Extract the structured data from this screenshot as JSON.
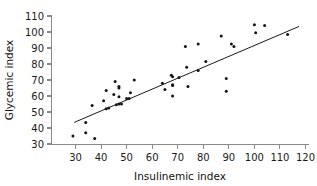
{
  "chart_data": {
    "type": "scatter",
    "title": "",
    "xlabel": "Insulinemic index",
    "ylabel": "Glycemic index",
    "xlim": [
      25,
      122
    ],
    "ylim": [
      27,
      112
    ],
    "xticks": [
      30,
      40,
      50,
      60,
      70,
      80,
      90,
      100,
      110,
      120
    ],
    "yticks": [
      30,
      40,
      50,
      60,
      70,
      80,
      90,
      100,
      110
    ],
    "grid": false,
    "legend": null,
    "points": [
      {
        "x": 29,
        "y": 35
      },
      {
        "x": 34,
        "y": 43.5
      },
      {
        "x": 34,
        "y": 37
      },
      {
        "x": 37.5,
        "y": 33.5
      },
      {
        "x": 36.5,
        "y": 54
      },
      {
        "x": 41,
        "y": 57
      },
      {
        "x": 42,
        "y": 63.5
      },
      {
        "x": 42,
        "y": 52
      },
      {
        "x": 43,
        "y": 52.5
      },
      {
        "x": 45.5,
        "y": 69
      },
      {
        "x": 45,
        "y": 61
      },
      {
        "x": 46,
        "y": 54.5
      },
      {
        "x": 47,
        "y": 66
      },
      {
        "x": 47,
        "y": 65
      },
      {
        "x": 47,
        "y": 59.5
      },
      {
        "x": 47,
        "y": 55
      },
      {
        "x": 48,
        "y": 55
      },
      {
        "x": 50,
        "y": 58.5
      },
      {
        "x": 51,
        "y": 58.5
      },
      {
        "x": 51.5,
        "y": 62
      },
      {
        "x": 53,
        "y": 70
      },
      {
        "x": 64,
        "y": 68
      },
      {
        "x": 65,
        "y": 64
      },
      {
        "x": 67.5,
        "y": 73
      },
      {
        "x": 68,
        "y": 72
      },
      {
        "x": 68,
        "y": 67
      },
      {
        "x": 68,
        "y": 60
      },
      {
        "x": 68,
        "y": 66.5
      },
      {
        "x": 70.5,
        "y": 71.5
      },
      {
        "x": 73,
        "y": 91
      },
      {
        "x": 73.5,
        "y": 78
      },
      {
        "x": 74,
        "y": 66
      },
      {
        "x": 78,
        "y": 92.5
      },
      {
        "x": 78,
        "y": 76
      },
      {
        "x": 81,
        "y": 81.5
      },
      {
        "x": 87,
        "y": 97.5
      },
      {
        "x": 89,
        "y": 71
      },
      {
        "x": 89,
        "y": 63
      },
      {
        "x": 91,
        "y": 92.5
      },
      {
        "x": 92,
        "y": 91
      },
      {
        "x": 100,
        "y": 104.5
      },
      {
        "x": 100.5,
        "y": 99.5
      },
      {
        "x": 104,
        "y": 104
      },
      {
        "x": 113,
        "y": 98.5
      }
    ],
    "fit_line": {
      "name": "regression line",
      "x0": 29.5,
      "y0": 43.5,
      "x1": 117.5,
      "y1": 103.5
    }
  }
}
